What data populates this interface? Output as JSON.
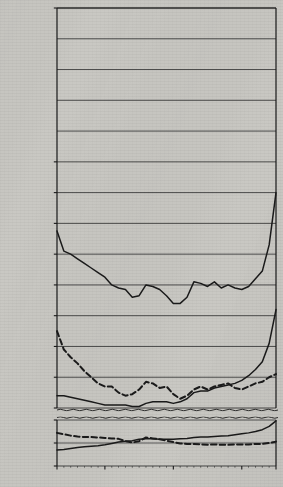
{
  "figure": {
    "title": "Crime Rates in the United States Against the Person",
    "ylabel": "(Rates Per 100,000 Population)"
  },
  "axis": {
    "y_upper_ticks": [
      "300",
      "200",
      "180",
      "160",
      "140",
      "120",
      "100",
      "80",
      "60",
      "40"
    ],
    "y_lower_ticks": [
      "10",
      "5",
      "0"
    ],
    "x_ticks": [
      "1933",
      "1940",
      "1950",
      "1960",
      "1965"
    ]
  },
  "labels": {
    "total": "Total Index Crimes Against the Person",
    "aggravated_assault": "Aggravated assault",
    "robbery": "Robbery",
    "forcible_rape": "Forcible rape",
    "willful_homicide": "Willful homicide"
  },
  "colors": {
    "ink": "#1a1a1a",
    "grid": "#3a3a3a",
    "paper": "#c9c8c3"
  },
  "chart_data": {
    "type": "line",
    "title": "Crime Rates in the United States Against the Person",
    "xlabel": "",
    "ylabel": "(Rates Per 100,000 Population)",
    "grid": true,
    "legend": "inline-annotations",
    "broken_axis": true,
    "ylim_upper": [
      40,
      300
    ],
    "ylim_lower": [
      0,
      10
    ],
    "xlim": [
      1933,
      1965
    ],
    "x": [
      1933,
      1934,
      1935,
      1936,
      1937,
      1938,
      1939,
      1940,
      1941,
      1942,
      1943,
      1944,
      1945,
      1946,
      1947,
      1948,
      1949,
      1950,
      1951,
      1952,
      1953,
      1954,
      1955,
      1956,
      1957,
      1958,
      1959,
      1960,
      1961,
      1962,
      1963,
      1964,
      1965
    ],
    "series": [
      {
        "name": "Total Index Crimes Against the Person",
        "style": "solid",
        "panel": "upper",
        "values": [
          155,
          142,
          140,
          137,
          134,
          131,
          128,
          125,
          120,
          118,
          117,
          112,
          113,
          120,
          119,
          117,
          113,
          108,
          108,
          112,
          122,
          121,
          119,
          122,
          118,
          120,
          118,
          117,
          119,
          124,
          129,
          146,
          180
        ]
      },
      {
        "name": "Aggravated assault",
        "style": "solid",
        "panel": "upper",
        "values": [
          48,
          48,
          47,
          46,
          45,
          44,
          43,
          42,
          42,
          42,
          42,
          41,
          41,
          43,
          44,
          44,
          44,
          43,
          44,
          46,
          50,
          51,
          51,
          53,
          54,
          55,
          56,
          58,
          61,
          65,
          70,
          82,
          104
        ]
      },
      {
        "name": "Robbery",
        "style": "dashed",
        "panel": "upper",
        "values": [
          90,
          78,
          73,
          69,
          64,
          60,
          56,
          54,
          54,
          50,
          48,
          49,
          52,
          57,
          56,
          53,
          54,
          49,
          46,
          48,
          52,
          54,
          52,
          54,
          55,
          56,
          53,
          52,
          54,
          56,
          57,
          60,
          62
        ]
      },
      {
        "name": "Forcible rape",
        "style": "solid",
        "panel": "lower",
        "values": [
          3.5,
          3.6,
          3.8,
          4.0,
          4.2,
          4.3,
          4.4,
          4.6,
          4.9,
          5.2,
          5.4,
          5.5,
          5.8,
          5.9,
          5.9,
          5.8,
          5.8,
          5.8,
          5.9,
          6.0,
          6.2,
          6.3,
          6.3,
          6.4,
          6.5,
          6.6,
          6.8,
          7.0,
          7.2,
          7.5,
          7.9,
          8.6,
          9.8
        ]
      },
      {
        "name": "Willful homicide",
        "style": "dashed",
        "panel": "lower",
        "values": [
          7.2,
          6.9,
          6.6,
          6.4,
          6.3,
          6.3,
          6.2,
          6.1,
          6.0,
          5.9,
          5.4,
          5.1,
          5.4,
          6.2,
          6.0,
          5.8,
          5.5,
          5.2,
          4.9,
          4.8,
          4.8,
          4.7,
          4.6,
          4.7,
          4.6,
          4.6,
          4.7,
          4.7,
          4.7,
          4.8,
          4.8,
          5.0,
          5.3
        ]
      }
    ]
  }
}
